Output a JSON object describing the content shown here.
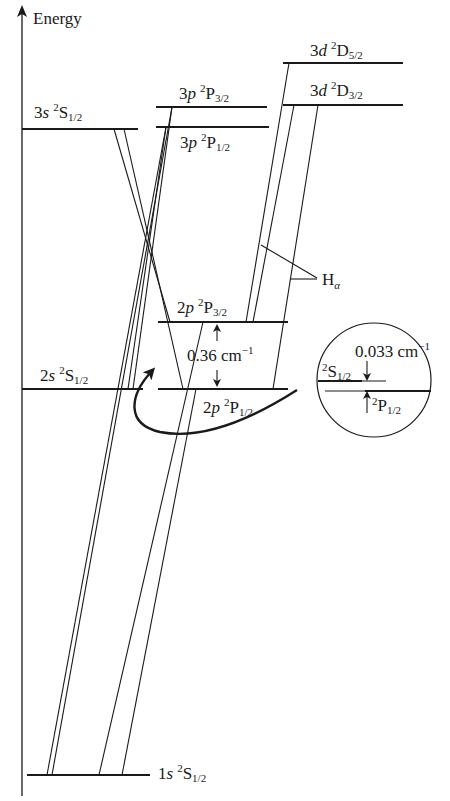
{
  "axis": {
    "label": "Energy"
  },
  "levels": {
    "d52": {
      "orbital": "3d",
      "sup": "2",
      "term": "D",
      "sub": "5/2"
    },
    "d32": {
      "orbital": "3d",
      "sup": "2",
      "term": "D",
      "sub": "3/2"
    },
    "p3_32": {
      "orbital": "3p",
      "sup": "2",
      "term": "P",
      "sub": "3/2"
    },
    "p3_12": {
      "orbital": "3p",
      "sup": "2",
      "term": "P",
      "sub": "1/2"
    },
    "s3": {
      "orbital": "3s",
      "sup": "2",
      "term": "S",
      "sub": "1/2"
    },
    "p2_32": {
      "orbital": "2p",
      "sup": "2",
      "term": "P",
      "sub": "3/2"
    },
    "p2_12": {
      "orbital": "2p",
      "sup": "2",
      "term": "P",
      "sub": "1/2"
    },
    "s2": {
      "orbital": "2s",
      "sup": "2",
      "term": "S",
      "sub": "1/2"
    },
    "s1": {
      "orbital": "1s",
      "sup": "2",
      "term": "S",
      "sub": "1/2"
    }
  },
  "annotations": {
    "fine_structure_split": {
      "value": "0.36 cm",
      "exp": "−1"
    },
    "lamb_shift": {
      "value": "0.033 cm",
      "exp": "−1"
    },
    "h_alpha": {
      "main": "H",
      "sub": "α"
    }
  },
  "inset": {
    "upper": {
      "sup": "2",
      "term": "S",
      "sub": "1/2"
    },
    "lower": {
      "sup": "2",
      "term": "P",
      "sub": "1/2"
    }
  }
}
